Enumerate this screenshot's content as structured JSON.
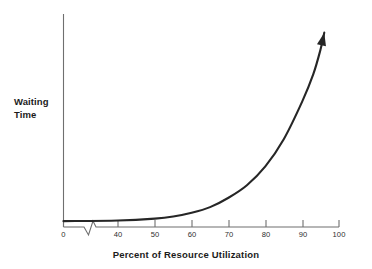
{
  "chart_data": {
    "type": "line",
    "title": "",
    "xlabel": "Percent of Resource Utilization",
    "ylabel_lines": [
      "Waiting",
      "Time"
    ],
    "ylabel": "Waiting Time",
    "xlim": [
      0,
      100
    ],
    "ylim": [
      0,
      1
    ],
    "grid": false,
    "legend": null,
    "axis_break": {
      "present": true,
      "axis": "x",
      "between": [
        0,
        40
      ],
      "symbol": "zigzag"
    },
    "y_axis_ticks": [],
    "y_axis_tick_labels": [],
    "xticks": [
      0,
      40,
      50,
      60,
      70,
      80,
      90,
      100
    ],
    "xtick_labels": [
      "0",
      "40",
      "50",
      "60",
      "70",
      "80",
      "90",
      "100"
    ],
    "series": [
      {
        "name": "Waiting Time",
        "arrow_end": true,
        "color": "#262626",
        "x": [
          0,
          40,
          50,
          55,
          60,
          65,
          70,
          75,
          80,
          85,
          90,
          93,
          95,
          96
        ],
        "y": [
          0.028,
          0.031,
          0.04,
          0.05,
          0.068,
          0.095,
          0.14,
          0.2,
          0.29,
          0.42,
          0.6,
          0.73,
          0.85,
          0.93
        ]
      }
    ],
    "annotations": [
      {
        "type": "arrowhead",
        "at_x": 96,
        "at_y": 0.95,
        "note": "filled triangular arrowhead at upper end of curve"
      }
    ]
  },
  "colors": {
    "background": "#ffffff",
    "curve": "#262626",
    "axis": "#6f6f6f",
    "text": "#1b1b1b",
    "tick_text": "#2e2e2e"
  },
  "icons": {
    "curve_arrow": "arrow-up-right-icon",
    "axis_break": "axis-break-zigzag-icon"
  }
}
